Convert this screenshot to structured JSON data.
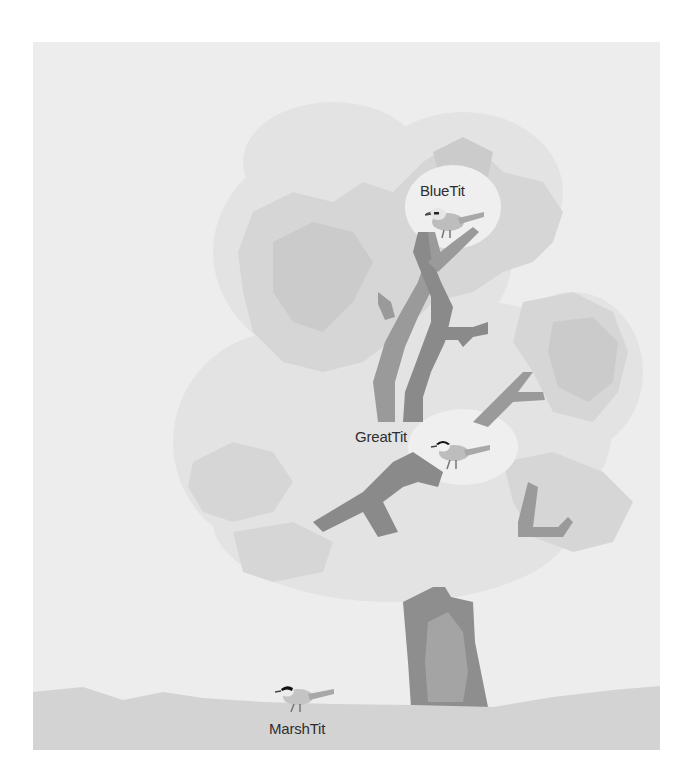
{
  "figure": {
    "type": "illustration",
    "colors": {
      "background": "#ededed",
      "foliage_light": "#e2e2e2",
      "foliage_mid": "#d6d6d6",
      "foliage_dark": "#cacaca",
      "branch": "#9a9a9a",
      "branch_dark": "#858585",
      "trunk": "#8e8e8e",
      "trunk_highlight": "#a4a4a4",
      "ground": "#d3d3d3",
      "label_text": "#2e2e2e"
    },
    "birds": [
      {
        "name": "BlueTit",
        "position": "top of canopy",
        "label": "BlueTit"
      },
      {
        "name": "GreatTit",
        "position": "middle of canopy",
        "label": "GreatTit"
      },
      {
        "name": "MarshTit",
        "position": "ground",
        "label": "MarshTit"
      }
    ]
  }
}
